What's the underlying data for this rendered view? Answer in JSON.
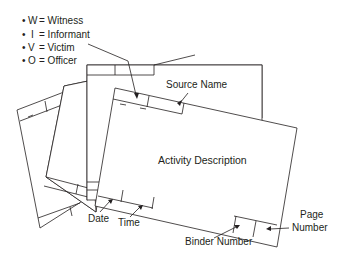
{
  "legend": {
    "items": [
      {
        "bullet": "•",
        "code": "W",
        "label": "= Witness"
      },
      {
        "bullet": "•",
        "code": "I",
        "label": "= Informant"
      },
      {
        "bullet": "•",
        "code": "V",
        "label": "= Victim"
      },
      {
        "bullet": "•",
        "code": "O",
        "label": "= Officer"
      }
    ]
  },
  "front_card": {
    "center_label": "Activity Description",
    "source_name_label": "Source Name",
    "date_label": "Date",
    "time_label": "Time",
    "binder_number_label": "Binder Number",
    "page_number_label_line1": "Page",
    "page_number_label_line2": "Number"
  },
  "colors": {
    "stroke": "#231f20",
    "background": "#ffffff"
  }
}
